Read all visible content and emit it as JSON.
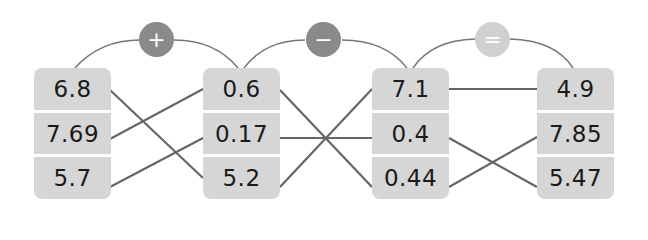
{
  "diagram": {
    "columns": [
      {
        "values": [
          "6.8",
          "7.69",
          "5.7"
        ]
      },
      {
        "values": [
          "0.6",
          "0.17",
          "5.2"
        ]
      },
      {
        "values": [
          "7.1",
          "0.4",
          "0.44"
        ]
      },
      {
        "values": [
          "4.9",
          "7.85",
          "5.47"
        ]
      }
    ],
    "operators": [
      {
        "symbol": "+",
        "name": "plus",
        "color": "#8a8a8a"
      },
      {
        "symbol": "−",
        "name": "minus",
        "color": "#8a8a8a"
      },
      {
        "symbol": "=",
        "name": "equals",
        "color": "#d0d0d0"
      }
    ],
    "connections": [
      {
        "from": "6.8",
        "to": "5.2"
      },
      {
        "from": "7.69",
        "to": "0.6"
      },
      {
        "from": "5.7",
        "to": "0.17"
      },
      {
        "from": "0.6",
        "to": "0.44"
      },
      {
        "from": "0.17",
        "to": "0.4"
      },
      {
        "from": "5.2",
        "to": "7.1"
      },
      {
        "from": "7.1",
        "to": "4.9"
      },
      {
        "from": "0.4",
        "to": "5.47"
      },
      {
        "from": "0.44",
        "to": "7.85"
      }
    ],
    "colors": {
      "cell": "#d6d6d6",
      "line": "#666666",
      "text": "#1a1a1a"
    }
  }
}
